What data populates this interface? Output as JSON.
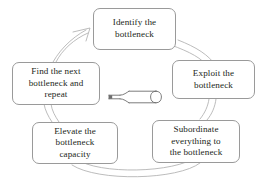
{
  "diagram": {
    "type": "cycle-diagram",
    "direction": "clockwise",
    "background_color": "#ffffff",
    "node_border_color": "#9a9a9a",
    "connector_color": "#b0b0b0",
    "text_color": "#231f20",
    "center_icon": {
      "name": "bottle-icon",
      "label": "bottle",
      "orientation": "horizontal",
      "neck_side": "left"
    },
    "nodes": [
      {
        "id": "identify",
        "label": "Identify the\nbottleneck",
        "position": "top"
      },
      {
        "id": "exploit",
        "label": "Exploit the\nbottleneck",
        "position": "right"
      },
      {
        "id": "subordinate",
        "label": "Subordinate\neverything to\nthe bottleneck",
        "position": "bottom-right"
      },
      {
        "id": "elevate",
        "label": "Elevate the\nbottleneck\ncapacity",
        "position": "bottom-left"
      },
      {
        "id": "find",
        "label": "Find the next\nbottleneck and\nrepeat",
        "position": "left"
      }
    ],
    "connectors": [
      {
        "from": "identify",
        "to": "exploit",
        "style": "double-arc"
      },
      {
        "from": "exploit",
        "to": "subordinate",
        "style": "double-arc"
      },
      {
        "from": "subordinate",
        "to": "elevate",
        "style": "double-arc"
      },
      {
        "from": "elevate",
        "to": "find",
        "style": "double-arc"
      },
      {
        "from": "find",
        "to": "identify",
        "style": "double-arc-with-arrowhead",
        "arrowhead": "open-chevron"
      }
    ]
  }
}
